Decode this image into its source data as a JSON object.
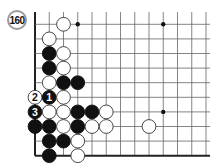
{
  "diagram": {
    "move_number_label": "160",
    "grid": {
      "origin_x": 35,
      "origin_y": 24.3,
      "dx": 14.25,
      "dy": 14.6,
      "cols": 13,
      "rows": 10,
      "top_extend": 12,
      "left_edge": true,
      "bottom_edge": true,
      "right_edge": false
    },
    "colors": {
      "line": "#666666",
      "edge": "#222222",
      "black": "#111111",
      "white": "#ffffff",
      "stone_outline": "#333333",
      "label_rim": "#9a9a9a"
    },
    "hoshi": [
      {
        "c": 3,
        "r": 0
      },
      {
        "c": 9,
        "r": 0
      },
      {
        "c": 9,
        "r": 6
      }
    ],
    "stones": [
      {
        "c": 2,
        "r": 0,
        "color": "white"
      },
      {
        "c": 1,
        "r": 1,
        "color": "white"
      },
      {
        "c": 1,
        "r": 2,
        "color": "black"
      },
      {
        "c": 2,
        "r": 2,
        "color": "white"
      },
      {
        "c": 1,
        "r": 3,
        "color": "black"
      },
      {
        "c": 2,
        "r": 3,
        "color": "white"
      },
      {
        "c": 1,
        "r": 4,
        "color": "white"
      },
      {
        "c": 2,
        "r": 4,
        "color": "black"
      },
      {
        "c": 3,
        "r": 4,
        "color": "black"
      },
      {
        "c": 0,
        "r": 5,
        "color": "white",
        "label": "2"
      },
      {
        "c": 1,
        "r": 5,
        "color": "black",
        "label": "1"
      },
      {
        "c": 2,
        "r": 5,
        "color": "white"
      },
      {
        "c": 0,
        "r": 6,
        "color": "black",
        "label": "3"
      },
      {
        "c": 1,
        "r": 6,
        "color": "white"
      },
      {
        "c": 2,
        "r": 6,
        "color": "white"
      },
      {
        "c": 3,
        "r": 6,
        "color": "black"
      },
      {
        "c": 4,
        "r": 6,
        "color": "black"
      },
      {
        "c": 5,
        "r": 6,
        "color": "white"
      },
      {
        "c": 0,
        "r": 7,
        "color": "black"
      },
      {
        "c": 1,
        "r": 7,
        "color": "black"
      },
      {
        "c": 2,
        "r": 7,
        "color": "white"
      },
      {
        "c": 3,
        "r": 7,
        "color": "black"
      },
      {
        "c": 4,
        "r": 7,
        "color": "white"
      },
      {
        "c": 5,
        "r": 7,
        "color": "white"
      },
      {
        "c": 8,
        "r": 7,
        "color": "white"
      },
      {
        "c": 1,
        "r": 8,
        "color": "black"
      },
      {
        "c": 2,
        "r": 8,
        "color": "black"
      },
      {
        "c": 3,
        "r": 8,
        "color": "white"
      },
      {
        "c": 1,
        "r": 9,
        "color": "black"
      },
      {
        "c": 3,
        "r": 9,
        "color": "white"
      }
    ]
  }
}
